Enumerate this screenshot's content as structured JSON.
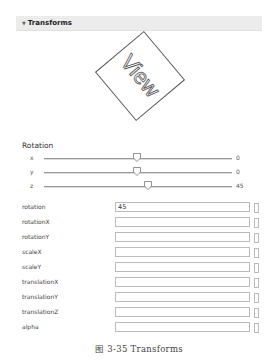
{
  "panel": {
    "title": "Transforms",
    "collapse_icon": "triangle-down-icon"
  },
  "preview": {
    "label": "View",
    "rotation_deg": 45
  },
  "rotation": {
    "label": "Rotation",
    "sliders": [
      {
        "axis": "x",
        "value": "0",
        "thumb_pct": 50
      },
      {
        "axis": "y",
        "value": "0",
        "thumb_pct": 50
      },
      {
        "axis": "z",
        "value": "45",
        "thumb_pct": 56
      }
    ]
  },
  "properties": [
    {
      "label": "rotation",
      "value": "45"
    },
    {
      "label": "rotationX",
      "value": ""
    },
    {
      "label": "rotationY",
      "value": ""
    },
    {
      "label": "scaleX",
      "value": ""
    },
    {
      "label": "scaleY",
      "value": ""
    },
    {
      "label": "translationX",
      "value": ""
    },
    {
      "label": "translationY",
      "value": ""
    },
    {
      "label": "translationZ",
      "value": ""
    },
    {
      "label": "alpha",
      "value": ""
    }
  ],
  "caption": "图 3-35    Transforms"
}
